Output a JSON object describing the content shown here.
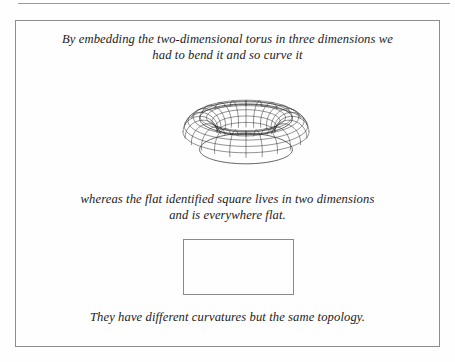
{
  "page": {
    "background_color": "#fefefe",
    "frame_border_color": "#8d8d8d",
    "text_color": "#1a1a1a"
  },
  "caption_top": {
    "line1": "By embedding the two-dimensional torus in three dimensions we",
    "line2": "had to bend it and so curve it"
  },
  "caption_middle": {
    "line1": "whereas the flat identified square lives in two dimensions",
    "line2": "and is everywhere flat."
  },
  "caption_bottom": {
    "line1": "They have different curvatures but the same topology."
  },
  "figures": {
    "torus": {
      "name": "torus-wireframe",
      "description": "three-dimensional torus drawn as a wireframe mesh",
      "stroke_color": "#2b2b2b",
      "major_lines": 24,
      "minor_lines": 16
    },
    "square": {
      "name": "flat-identified-square",
      "description": "empty rectangle representing the flat identified square",
      "stroke_color": "#8a8a8a"
    }
  }
}
